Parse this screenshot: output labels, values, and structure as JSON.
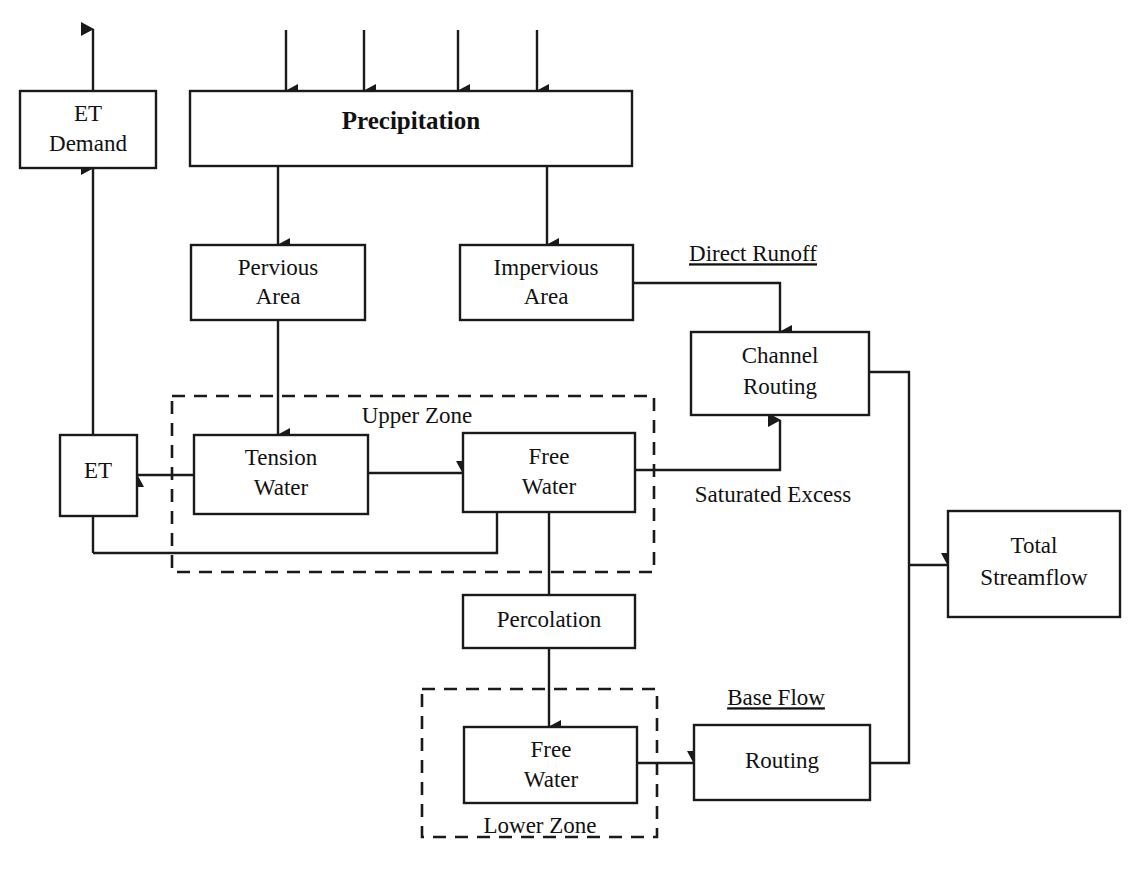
{
  "diagram": {
    "colors": {
      "stroke": "#1a1a1a",
      "fill": "#ffffff",
      "text": "#111111",
      "background": "#ffffff"
    },
    "nodes": {
      "et_demand": {
        "label_line1": "ET",
        "label_line2": "Demand"
      },
      "precipitation": {
        "label": "Precipitation"
      },
      "pervious_area": {
        "label_line1": "Pervious",
        "label_line2": "Area"
      },
      "impervious_area": {
        "label_line1": "Impervious",
        "label_line2": "Area"
      },
      "channel_routing": {
        "label_line1": "Channel",
        "label_line2": "Routing"
      },
      "et": {
        "label": "ET"
      },
      "upper_tension_water": {
        "label_line1": "Tension",
        "label_line2": "Water"
      },
      "upper_free_water": {
        "label_line1": "Free",
        "label_line2": "Water"
      },
      "total_streamflow": {
        "label_line1": "Total",
        "label_line2": "Streamflow"
      },
      "percolation": {
        "label": "Percolation"
      },
      "lower_free_water": {
        "label_line1": "Free",
        "label_line2": "Water"
      },
      "baseflow_routing": {
        "label": "Routing"
      }
    },
    "zones": {
      "upper_zone": {
        "label": "Upper Zone"
      },
      "lower_zone": {
        "label": "Lower Zone"
      }
    },
    "edge_labels": {
      "direct_runoff": {
        "label": "Direct Runoff"
      },
      "saturated_excess": {
        "label": "Saturated Excess"
      },
      "base_flow": {
        "label": "Base Flow"
      }
    }
  }
}
